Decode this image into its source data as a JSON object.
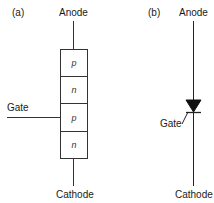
{
  "panel_a": {
    "tag": "(a)",
    "anode_label": "Anode",
    "cathode_label": "Cathode",
    "gate_label": "Gate",
    "layers": [
      "p",
      "n",
      "p",
      "n"
    ]
  },
  "panel_b": {
    "tag": "(b)",
    "anode_label": "Anode",
    "cathode_label": "Cathode",
    "gate_label": "Gate",
    "symbol": "thyristor"
  },
  "colors": {
    "line": "#222222",
    "background": "#ffffff"
  }
}
